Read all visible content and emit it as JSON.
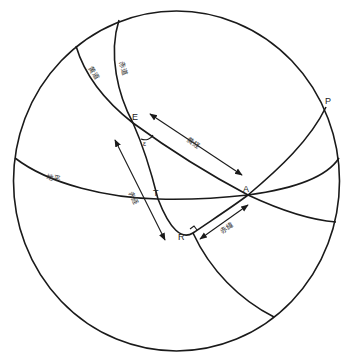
{
  "diagram": {
    "type": "celestial-sphere",
    "points": {
      "E": "E",
      "A": "A",
      "T": "T",
      "R": "R",
      "P": "P"
    },
    "angle_label": "ε",
    "circles": {
      "ecliptic": "黄道",
      "equator": "赤道",
      "horizon": "地平"
    },
    "arcs": {
      "ecliptic_longitude": "黄経",
      "right_ascension": "赤経",
      "declination": "赤緯"
    },
    "colors": {
      "line": "#1a1a1a",
      "background": "#ffffff"
    }
  }
}
